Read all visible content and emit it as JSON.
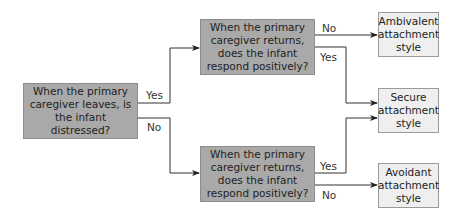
{
  "diagram": {
    "type": "flowchart",
    "nodes": {
      "start": "When the primary caregiver leaves, is the infant distressed?",
      "q_top": "When the primary caregiver returns, does the infant respond positively?",
      "q_bottom": "When the primary caregiver returns, does the infant respond positively?",
      "ambivalent": "Ambivalent attachment style",
      "secure": "Secure attachment style",
      "avoidant": "Avoidant attachment style"
    },
    "edge_labels": {
      "start_yes": "Yes",
      "start_no": "No",
      "top_no": "No",
      "top_yes": "Yes",
      "bottom_yes": "Yes",
      "bottom_no": "No"
    },
    "colors": {
      "question_fill": "#a9a9a9",
      "result_fill": "#efefef",
      "line": "#333333"
    }
  }
}
